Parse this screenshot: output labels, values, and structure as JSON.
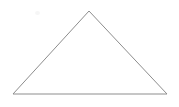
{
  "figure": {
    "canvas": {
      "width": 179,
      "height": 107,
      "background_color": "#ffffff"
    },
    "stroke": {
      "color": "#8d8d8d",
      "width": 1,
      "style": "solid-antialiased"
    },
    "shape": {
      "name": "triangle",
      "kind": "isosceles",
      "vertices": [
        {
          "label": "apex",
          "x": 89,
          "y": 11
        },
        {
          "label": "bottom-right",
          "x": 167,
          "y": 94
        },
        {
          "label": "bottom-left",
          "x": 13,
          "y": 94
        }
      ],
      "points_attr": "89,11 167,94 13,94",
      "edges": [
        {
          "name": "left-edge",
          "from": "bottom-left",
          "to": "apex"
        },
        {
          "name": "right-edge",
          "from": "apex",
          "to": "bottom-right"
        },
        {
          "name": "base-edge",
          "from": "bottom-left",
          "to": "bottom-right"
        }
      ]
    },
    "artifacts": [
      {
        "name": "scan-speckle",
        "x": 35,
        "y": 11,
        "width": 5,
        "height": 4,
        "color": "#f6f6f6"
      }
    ]
  }
}
